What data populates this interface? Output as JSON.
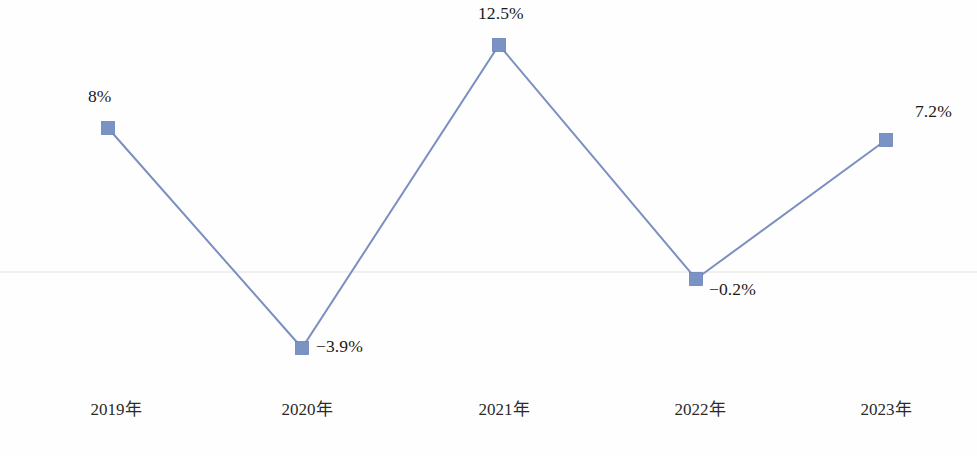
{
  "chart_data": {
    "type": "line",
    "title": "",
    "subtitle": "",
    "xlabel": "",
    "ylabel": "",
    "categories": [
      "2019年",
      "2020年",
      "2021年",
      "2022年",
      "2023年"
    ],
    "values": [
      8,
      -3.9,
      12.5,
      -0.2,
      7.2
    ],
    "point_labels": [
      "8%",
      "-3.9%",
      "12.5%",
      "-0.2%",
      "7.2%"
    ],
    "series": [
      {
        "name": "",
        "values": [
          8,
          -3.9,
          12.5,
          -0.2,
          7.2
        ]
      }
    ],
    "ylim": [
      -5.0,
      14.5
    ],
    "grid": false,
    "zero_line": true,
    "legend": "none",
    "axis_visible": false,
    "marker": "square",
    "colors": {
      "line": "#7b8fc0",
      "marker": "#7b92c4",
      "marker_border": "#6b81b8",
      "zero_line": "#f0eaea",
      "label_text": "#1a1a1a",
      "category_text": "#2a2a2a",
      "background": "#fefefe"
    }
  },
  "layout": {
    "points_px": [
      {
        "x": 108,
        "y": 128
      },
      {
        "x": 302,
        "y": 348
      },
      {
        "x": 499,
        "y": 45
      },
      {
        "x": 696,
        "y": 279
      },
      {
        "x": 886,
        "y": 140
      }
    ],
    "label_px": [
      {
        "x": 88,
        "y": 88
      },
      {
        "x": 316,
        "y": 338
      },
      {
        "x": 478,
        "y": 5
      },
      {
        "x": 709,
        "y": 281
      },
      {
        "x": 915,
        "y": 103
      }
    ],
    "category_px": [
      {
        "x": 116,
        "y": 401
      },
      {
        "x": 307,
        "y": 401
      },
      {
        "x": 504,
        "y": 401
      },
      {
        "x": 700,
        "y": 401
      },
      {
        "x": 886,
        "y": 401
      }
    ],
    "zero_line_y": 272,
    "marker_size": 13
  }
}
